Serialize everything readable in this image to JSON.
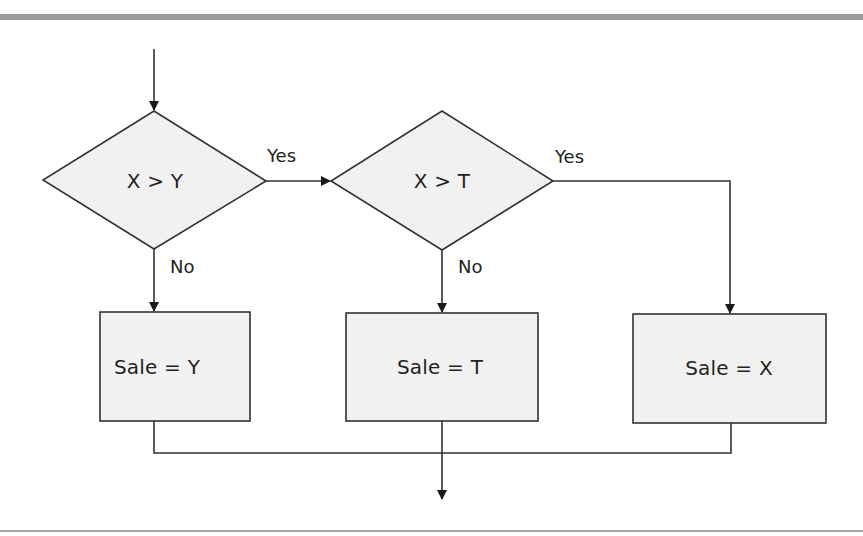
{
  "colors": {
    "node_fill": "#f1f1f1",
    "stroke": "#333333",
    "top_rule": "#9a9a9a",
    "bottom_rule": "#a8a8a8",
    "text": "#231f20"
  },
  "flowchart": {
    "decisions": [
      {
        "id": "d1",
        "label": "X > Y"
      },
      {
        "id": "d2",
        "label": "X > T"
      }
    ],
    "processes": [
      {
        "id": "p1",
        "label": "Sale = Y"
      },
      {
        "id": "p2",
        "label": "Sale = T"
      },
      {
        "id": "p3",
        "label": "Sale = X"
      }
    ],
    "edges": [
      {
        "from": "start",
        "to": "d1",
        "label": ""
      },
      {
        "from": "d1",
        "to": "d2",
        "label": "Yes"
      },
      {
        "from": "d1",
        "to": "p1",
        "label": "No"
      },
      {
        "from": "d2",
        "to": "p3",
        "label": "Yes"
      },
      {
        "from": "d2",
        "to": "p2",
        "label": "No"
      },
      {
        "from": "p1",
        "to": "end",
        "label": ""
      },
      {
        "from": "p2",
        "to": "end",
        "label": ""
      },
      {
        "from": "p3",
        "to": "end",
        "label": ""
      }
    ]
  }
}
